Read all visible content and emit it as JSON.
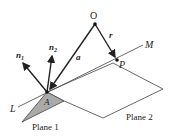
{
  "diagram": {
    "points": {
      "O": {
        "label": "O"
      },
      "P": {
        "label": "P"
      },
      "A": {
        "label": "A"
      }
    },
    "vectors": {
      "r": {
        "label": "r",
        "from": "O",
        "to": "P"
      },
      "a": {
        "label": "a",
        "from": "O",
        "to": "A"
      },
      "n1": {
        "label": "n",
        "sub": "1"
      },
      "n2": {
        "label": "n",
        "sub": "2"
      }
    },
    "line": {
      "start_label": "L",
      "end_label": "M"
    },
    "planes": [
      {
        "label": "Plane 1",
        "fill": "#aaaaaa"
      },
      {
        "label": "Plane 2",
        "fill": "#ffffff"
      }
    ],
    "colors": {
      "stroke": "#222222",
      "plane1_fill": "#aaaaaa"
    }
  }
}
